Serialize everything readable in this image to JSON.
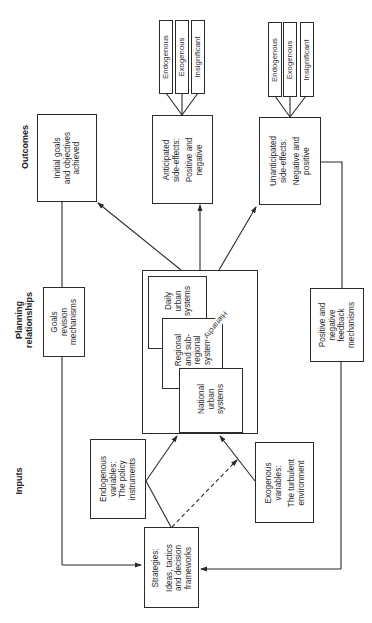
{
  "sections": {
    "outcomes": "Outcomes",
    "planning": [
      "Planning",
      "relationships"
    ],
    "inputs": "Inputs"
  },
  "outcomes": {
    "initial_goals": [
      "Initial goals",
      "and objectives",
      "achieved"
    ],
    "anticipated": {
      "lines": [
        "Anticipated",
        "side-effects:"
      ],
      "lines2": [
        "Positive and",
        "negative"
      ],
      "sub": [
        "Endogenous",
        "Exogenous",
        "Insignificant"
      ]
    },
    "unanticipated": {
      "lines": [
        "Unanticipated",
        "side-effects:"
      ],
      "lines2": [
        "Negative and",
        "positive"
      ],
      "sub": [
        "Endogenous",
        "Exogenous",
        "Insignificant"
      ]
    }
  },
  "planning": {
    "goals_revision": [
      "Goals",
      "revision",
      "mechanisms"
    ],
    "daily": [
      "Daily",
      "urban",
      "systems"
    ],
    "regional": [
      "Regional",
      "and sub-",
      "regional",
      "systems"
    ],
    "national": [
      "National",
      "urban",
      "systems"
    ],
    "hierarchy": "Hierarchy",
    "feedback": [
      "Positive and",
      "negative",
      "feedback",
      "mechanisms"
    ]
  },
  "inputs": {
    "endogenous": {
      "lines": [
        "Endogenous",
        "variables:"
      ],
      "lines2": [
        "The policy",
        "instruments"
      ]
    },
    "exogenous": {
      "lines": [
        "Exogenous",
        "variables:"
      ],
      "lines2": [
        "The turbulent",
        "environment"
      ]
    },
    "strategies": {
      "lines": [
        "Strategies:"
      ],
      "lines2": [
        "Ideas, tactics",
        "and decision",
        "frameworks"
      ]
    }
  },
  "colors": {
    "line": "#2a2a2a",
    "background": "#ffffff"
  }
}
